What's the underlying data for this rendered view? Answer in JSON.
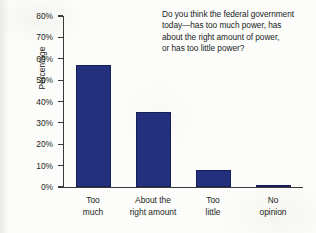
{
  "figure": {
    "question": {
      "lines": [
        "Do you think the federal government",
        "today—has too much power, has",
        "about the right amount of power,",
        "or has too little power?"
      ]
    },
    "colors": {
      "bar": "#22307e",
      "bar_edge": "#161f57",
      "axis": "#3a3a3a",
      "text": "#231f20",
      "background": "#fcfcfa"
    }
  },
  "chart_data": {
    "type": "bar",
    "title": "",
    "subtitle": "",
    "xlabel": "",
    "ylabel": "Percentage",
    "ylim": [
      0,
      80
    ],
    "grid": false,
    "legend": null,
    "ytick_labels": [
      "0%",
      "10%",
      "20%",
      "30%",
      "40%",
      "50%",
      "60%",
      "70%",
      "80%"
    ],
    "ytick_values": [
      0,
      10,
      20,
      30,
      40,
      50,
      60,
      70,
      80
    ],
    "categories": [
      "Too much",
      "About the right amount",
      "Too little",
      "No opinion"
    ],
    "category_label_lines": [
      [
        "Too",
        "much"
      ],
      [
        "About the",
        "right amount"
      ],
      [
        "Too",
        "little"
      ],
      [
        "No",
        "opinion"
      ]
    ],
    "values": [
      57,
      35,
      8,
      1
    ],
    "annotation": "Do you think the federal government today—has too much power, has about the right amount of power, or has too little power?"
  }
}
